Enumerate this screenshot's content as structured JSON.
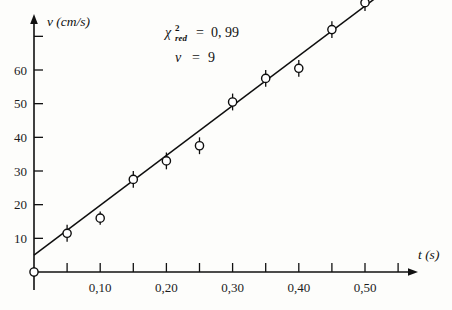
{
  "chart_data": {
    "type": "scatter",
    "title": "",
    "xlabel": "t (s)",
    "ylabel": "v (cm/s)",
    "xlim": [
      0,
      0.56
    ],
    "ylim": [
      0,
      82
    ],
    "grid": false,
    "legend": "none",
    "x": [
      0.0,
      0.05,
      0.1,
      0.15,
      0.2,
      0.25,
      0.3,
      0.35,
      0.4,
      0.45,
      0.5
    ],
    "y": [
      0.0,
      11.5,
      16.0,
      27.5,
      33.0,
      37.5,
      50.5,
      57.5,
      60.5,
      72.0,
      80.0
    ],
    "yerr": [
      1.5,
      2.5,
      2.0,
      2.5,
      2.5,
      2.5,
      2.5,
      2.5,
      2.5,
      2.5,
      2.5
    ],
    "xticks": [
      0.0,
      0.05,
      0.1,
      0.15,
      0.2,
      0.25,
      0.3,
      0.35,
      0.4,
      0.45,
      0.5,
      0.55
    ],
    "xtick_labels": [
      "",
      "",
      "0,10",
      "",
      "0,20",
      "",
      "0,30",
      "",
      "0,40",
      "",
      "0,50",
      ""
    ],
    "yticks": [
      10,
      20,
      30,
      40,
      50,
      60,
      70
    ],
    "ytick_labels": [
      "10",
      "20",
      "30",
      "40",
      "50",
      "60",
      ""
    ],
    "fit": {
      "type": "line",
      "intercept": 5.0,
      "slope": 148.0,
      "x_start": 0.0,
      "x_end": 0.525
    },
    "annotations": [
      {
        "name": "chi-squared-reduced",
        "symbol": "χ",
        "superscript": "2",
        "subscript": "red",
        "equals": "=",
        "value": "0, 99"
      },
      {
        "name": "degrees-of-freedom",
        "symbol": "ν",
        "equals": "=",
        "value": "9"
      }
    ],
    "colors": {
      "axis": "#111111",
      "marker": "#0e0e0e",
      "fit": "#0e0e0e",
      "background": "#fdfdfb"
    }
  }
}
